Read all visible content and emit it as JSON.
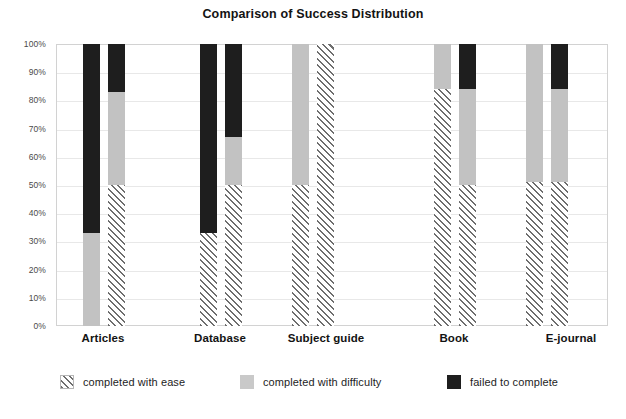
{
  "chart_data": {
    "type": "bar",
    "subtype": "stacked-percentage-grouped",
    "title": "Comparison of Success Distribution",
    "xlabel": "",
    "ylabel": "",
    "ylim": [
      0,
      100
    ],
    "grid": true,
    "legend_position": "bottom",
    "categories": [
      "Articles",
      "Database",
      "Subject guide",
      "Book",
      "E-journal"
    ],
    "y_ticks": [
      "0%",
      "10%",
      "20%",
      "30%",
      "40%",
      "50%",
      "60%",
      "70%",
      "80%",
      "90%",
      "100%"
    ],
    "y_tick_values": [
      0,
      10,
      20,
      30,
      40,
      50,
      60,
      70,
      80,
      90,
      100
    ],
    "series": [
      {
        "name": "completed with ease",
        "pattern": "diagonal-hatch",
        "color": "#6e6e6e",
        "values_group1": [
          0,
          33,
          50,
          84,
          51
        ],
        "values_group2": [
          50,
          50,
          100,
          50,
          51
        ]
      },
      {
        "name": "completed with difficulty",
        "pattern": "solid",
        "color": "#c2c2c2",
        "values_group1": [
          33,
          0,
          50,
          16,
          49
        ],
        "values_group2": [
          33,
          17,
          0,
          34,
          33
        ]
      },
      {
        "name": "failed to complete",
        "pattern": "solid",
        "color": "#1e1e1e",
        "values_group1": [
          67,
          67,
          0,
          0,
          0
        ],
        "values_group2": [
          17,
          33,
          0,
          16,
          16
        ]
      }
    ],
    "bars": [
      {
        "category": "Articles",
        "bar_index": 0,
        "segments": [
          {
            "series": "completed with ease",
            "start": 0,
            "end": 0,
            "value": 0
          },
          {
            "series": "completed with difficulty",
            "start": 0,
            "end": 33,
            "value": 33
          },
          {
            "series": "failed to complete",
            "start": 33,
            "end": 100,
            "value": 67
          }
        ]
      },
      {
        "category": "Articles",
        "bar_index": 1,
        "segments": [
          {
            "series": "completed with ease",
            "start": 0,
            "end": 50,
            "value": 50
          },
          {
            "series": "completed with difficulty",
            "start": 50,
            "end": 83,
            "value": 33
          },
          {
            "series": "failed to complete",
            "start": 83,
            "end": 100,
            "value": 17
          }
        ]
      },
      {
        "category": "Database",
        "bar_index": 0,
        "segments": [
          {
            "series": "completed with ease",
            "start": 0,
            "end": 33,
            "value": 33
          },
          {
            "series": "completed with difficulty",
            "start": 33,
            "end": 33,
            "value": 0
          },
          {
            "series": "failed to complete",
            "start": 33,
            "end": 100,
            "value": 67
          }
        ]
      },
      {
        "category": "Database",
        "bar_index": 1,
        "segments": [
          {
            "series": "completed with ease",
            "start": 0,
            "end": 50,
            "value": 50
          },
          {
            "series": "completed with difficulty",
            "start": 50,
            "end": 67,
            "value": 17
          },
          {
            "series": "failed to complete",
            "start": 67,
            "end": 100,
            "value": 33
          }
        ]
      },
      {
        "category": "Subject guide",
        "bar_index": 0,
        "segments": [
          {
            "series": "completed with ease",
            "start": 0,
            "end": 50,
            "value": 50
          },
          {
            "series": "completed with difficulty",
            "start": 50,
            "end": 100,
            "value": 50
          },
          {
            "series": "failed to complete",
            "start": 100,
            "end": 100,
            "value": 0
          }
        ]
      },
      {
        "category": "Subject guide",
        "bar_index": 1,
        "segments": [
          {
            "series": "completed with ease",
            "start": 0,
            "end": 100,
            "value": 100
          },
          {
            "series": "completed with difficulty",
            "start": 100,
            "end": 100,
            "value": 0
          },
          {
            "series": "failed to complete",
            "start": 100,
            "end": 100,
            "value": 0
          }
        ]
      },
      {
        "category": "Book",
        "bar_index": 0,
        "segments": [
          {
            "series": "completed with ease",
            "start": 0,
            "end": 84,
            "value": 84
          },
          {
            "series": "completed with difficulty",
            "start": 84,
            "end": 100,
            "value": 16
          },
          {
            "series": "failed to complete",
            "start": 100,
            "end": 100,
            "value": 0
          }
        ]
      },
      {
        "category": "Book",
        "bar_index": 1,
        "segments": [
          {
            "series": "completed with ease",
            "start": 0,
            "end": 50,
            "value": 50
          },
          {
            "series": "completed with difficulty",
            "start": 50,
            "end": 84,
            "value": 34
          },
          {
            "series": "failed to complete",
            "start": 84,
            "end": 100,
            "value": 16
          }
        ]
      },
      {
        "category": "E-journal",
        "bar_index": 0,
        "segments": [
          {
            "series": "completed with ease",
            "start": 0,
            "end": 51,
            "value": 51
          },
          {
            "series": "completed with difficulty",
            "start": 51,
            "end": 100,
            "value": 49
          },
          {
            "series": "failed to complete",
            "start": 100,
            "end": 100,
            "value": 0
          }
        ]
      },
      {
        "category": "E-journal",
        "bar_index": 1,
        "segments": [
          {
            "series": "completed with ease",
            "start": 0,
            "end": 51,
            "value": 51
          },
          {
            "series": "completed with difficulty",
            "start": 51,
            "end": 84,
            "value": 33
          },
          {
            "series": "failed to complete",
            "start": 84,
            "end": 100,
            "value": 16
          }
        ]
      }
    ],
    "bar_layout": {
      "bar_width_px": 17,
      "pairs_left_px": [
        27,
        52,
        144,
        169,
        236,
        261,
        378,
        403,
        470,
        495
      ]
    },
    "category_label_positions_px": [
      47,
      164,
      270,
      398,
      515
    ]
  },
  "legend": {
    "items": [
      {
        "label": "completed with ease",
        "swatch": "ease",
        "left_px": 60
      },
      {
        "label": "completed with difficulty",
        "swatch": "difficulty",
        "left_px": 240
      },
      {
        "label": "failed to complete",
        "swatch": "failed",
        "left_px": 447
      }
    ]
  },
  "colors": {
    "hatch_line": "#6e6e6e",
    "difficulty_gray": "#c2c2c2",
    "failed_black": "#1e1e1e",
    "gridline": "#e8e8e8",
    "frame": "#d2d2d2",
    "background": "#ffffff"
  }
}
